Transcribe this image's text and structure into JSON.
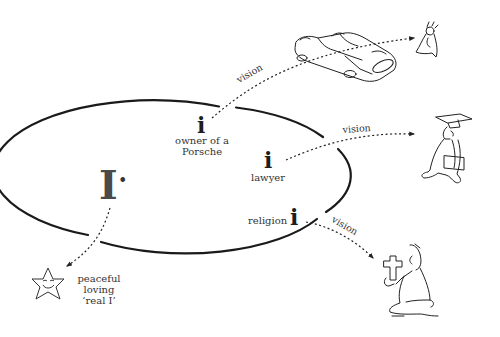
{
  "diagram": {
    "ellipse": {
      "cx": 195,
      "cy": 172,
      "rx": 150,
      "ry": 66,
      "stroke": "#1a1a1a"
    },
    "core_self": {
      "glyph": "I",
      "dot": "•"
    },
    "identities": [
      {
        "id": "porsche",
        "glyph": "i",
        "label_lines": [
          "owner of a",
          "Porsche"
        ],
        "vision_label": "vision",
        "target": "car-and-bride-drawing"
      },
      {
        "id": "lawyer",
        "glyph": "i",
        "label_lines": [
          "lawyer"
        ],
        "vision_label": "vision",
        "target": "graduate-drawing"
      },
      {
        "id": "religion",
        "glyph": "i",
        "label_prefix": "religion",
        "vision_label": "vision",
        "target": "praying-man-drawing"
      }
    ],
    "real_self": {
      "icon": "smiling-star-icon",
      "label_lines": [
        "peaceful",
        "loving",
        "‘real I’"
      ]
    }
  }
}
